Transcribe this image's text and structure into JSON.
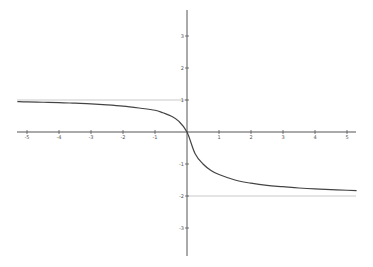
{
  "chart_data": {
    "type": "line",
    "title": "",
    "xlabel": "",
    "ylabel": "",
    "xlim": [
      -5.3,
      5.3
    ],
    "ylim": [
      -3.8,
      3.8
    ],
    "grid": false,
    "x_ticks": [
      -5,
      -4,
      -3,
      -2,
      -1,
      1,
      2,
      3,
      4,
      5
    ],
    "x_tick_labels": [
      "-5",
      "-4",
      "-3",
      "-2",
      "-1",
      "1",
      "2",
      "3",
      "4",
      "5"
    ],
    "y_ticks": [
      3,
      2,
      1,
      -1,
      -2,
      -3
    ],
    "y_tick_labels": [
      "3",
      "2",
      "1",
      "-1",
      "-2",
      "-3"
    ],
    "asymptotes": [
      {
        "name": "upper-asymptote",
        "y": 1,
        "x_range": [
          -5.3,
          0
        ]
      },
      {
        "name": "lower-asymptote",
        "y": -2,
        "x_range": [
          0,
          5.3
        ]
      }
    ],
    "series": [
      {
        "name": "curve",
        "x": [
          -5.3,
          -5,
          -4.5,
          -4,
          -3.5,
          -3,
          -2.5,
          -2,
          -1.5,
          -1,
          -0.75,
          -0.5,
          -0.25,
          0,
          0.25,
          0.5,
          0.75,
          1,
          1.5,
          2,
          2.5,
          3,
          3.5,
          4,
          4.5,
          5,
          5.3
        ],
        "y": [
          0.95,
          0.94,
          0.93,
          0.92,
          0.9,
          0.88,
          0.85,
          0.81,
          0.75,
          0.68,
          0.6,
          0.5,
          0.33,
          0,
          -0.67,
          -1.0,
          -1.2,
          -1.33,
          -1.5,
          -1.6,
          -1.67,
          -1.71,
          -1.75,
          -1.78,
          -1.8,
          -1.82,
          -1.83
        ]
      }
    ],
    "colors": {
      "axis": "#555555",
      "curve": "#444444",
      "asymptote": "#bbbbbb"
    }
  }
}
